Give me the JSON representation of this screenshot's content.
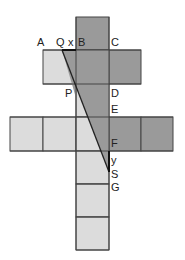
{
  "diagram": {
    "type": "net-of-squares",
    "unit": 33,
    "colors": {
      "light": "#dcdcdc",
      "dark": "#9a9a9a",
      "line": "#333333"
    },
    "labels": {
      "A": "A",
      "Q": "Q",
      "x": "x",
      "B": "B",
      "C": "C",
      "P": "P",
      "D": "D",
      "E": "E",
      "F": "F",
      "y": "y",
      "S": "S",
      "G": "G"
    }
  }
}
